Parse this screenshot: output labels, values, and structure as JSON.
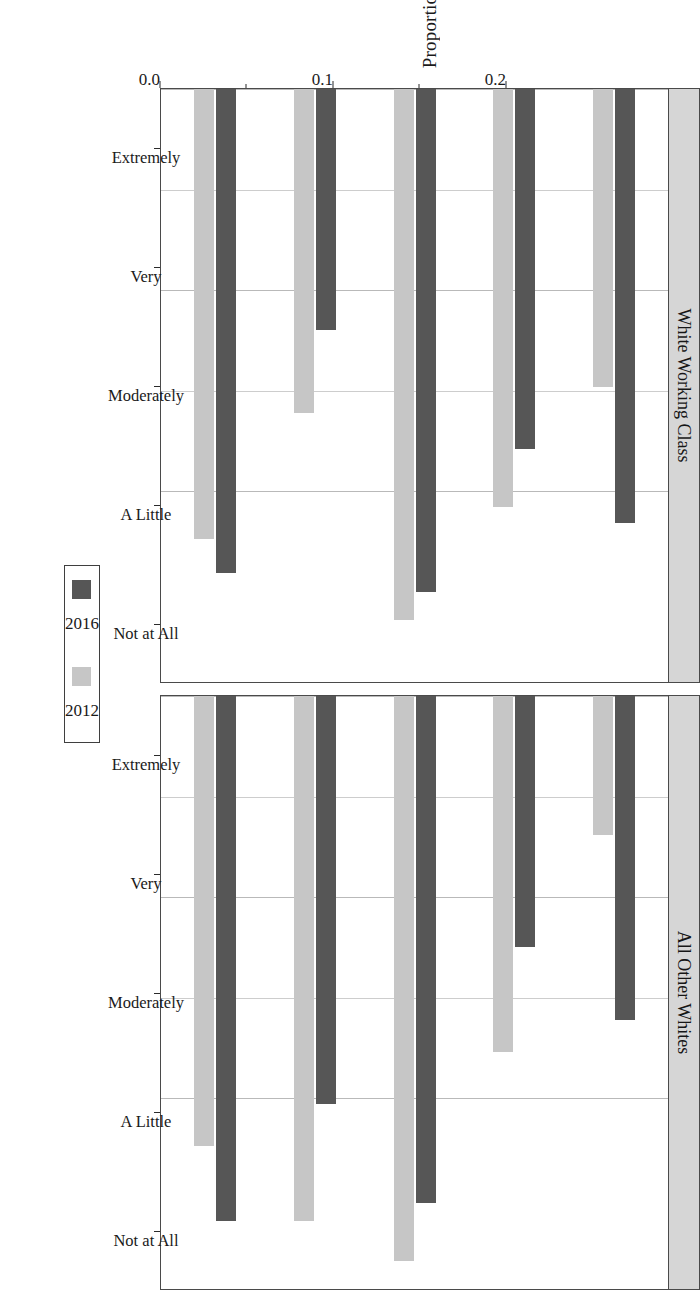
{
  "chart_data": {
    "type": "bar",
    "orientation": "horizontal-grouped",
    "title": "",
    "xlabel": "",
    "ylabel": "Proportion",
    "ylim": [
      0.0,
      0.295
    ],
    "yticks": [
      0.0,
      0.05,
      0.1,
      0.15,
      0.2
    ],
    "ytick_labels": [
      "0.0",
      "",
      "0.1",
      "",
      "0.2"
    ],
    "major_ticks": [
      0.0,
      0.1,
      0.2
    ],
    "grid": "vertical-gridlines-only",
    "legend": {
      "position": "bottom-center",
      "entries": [
        {
          "label": "2012",
          "color": "#c6c6c6"
        },
        {
          "label": "2016",
          "color": "#565656"
        }
      ]
    },
    "categories": [
      "Not at All",
      "A Little",
      "Moderately",
      "Very",
      "Extremely"
    ],
    "panels": [
      {
        "name": "White Working Class",
        "series": [
          {
            "name": "2012",
            "color": "#c6c6c6",
            "values": [
              0.224,
              0.161,
              0.264,
              0.208,
              0.148
            ]
          },
          {
            "name": "2016",
            "color": "#565656",
            "values": [
              0.241,
              0.12,
              0.25,
              0.179,
              0.216
            ]
          }
        ]
      },
      {
        "name": "All Other Whites",
        "series": [
          {
            "name": "2012",
            "color": "#c6c6c6",
            "values": [
              0.224,
              0.261,
              0.281,
              0.177,
              0.069
            ]
          },
          {
            "name": "2016",
            "color": "#565656",
            "values": [
              0.261,
              0.203,
              0.252,
              0.125,
              0.161
            ]
          }
        ]
      }
    ]
  },
  "axis": {
    "y_title": "Proportion",
    "tick_labels": [
      "0.0",
      "0.1",
      "0.2"
    ]
  },
  "legend": {
    "items": [
      {
        "label": "2012"
      },
      {
        "label": "2016"
      }
    ]
  },
  "panel_titles": {
    "left": "White Working Class",
    "right": "All Other Whites"
  },
  "category_labels": [
    "Not at All",
    "A Little",
    "Moderately",
    "Very",
    "Extremely"
  ],
  "colors": {
    "y2012": "#c6c6c6",
    "y2016": "#565656",
    "frame": "#4a4a4a",
    "strip": "#d6d6d6",
    "grid": "#cdcdcd",
    "background": "#ffffff"
  }
}
